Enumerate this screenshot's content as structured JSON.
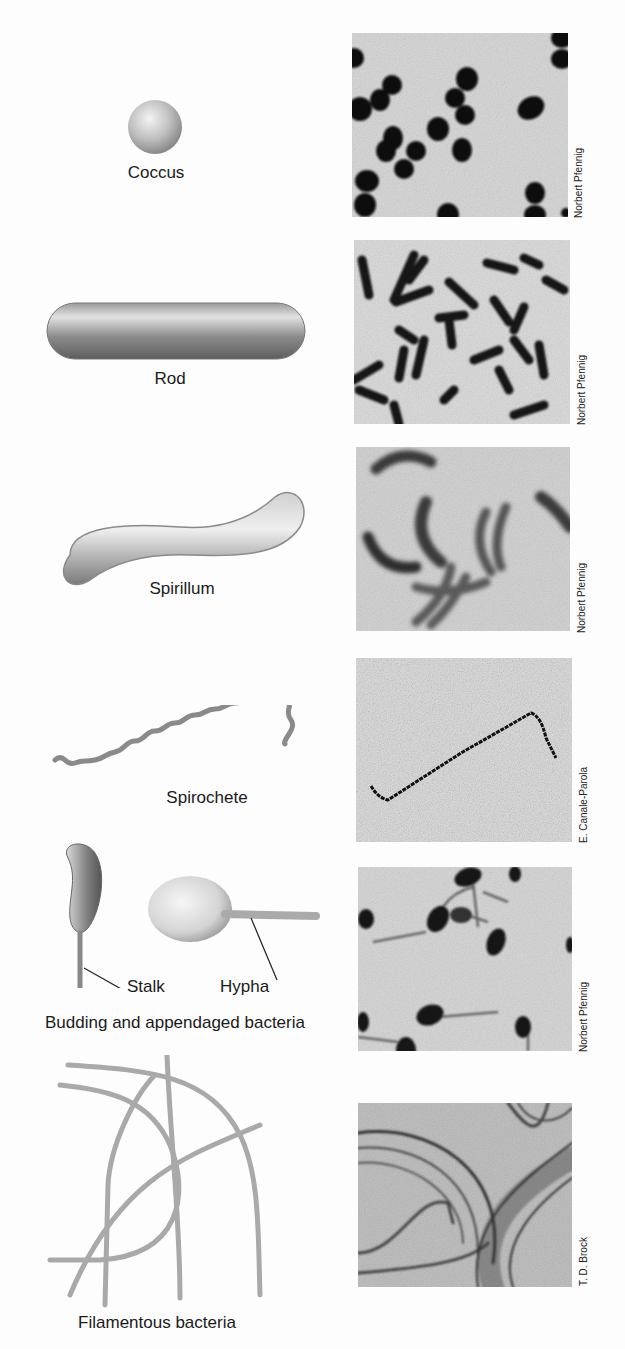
{
  "figure": {
    "rows": [
      {
        "id": "coccus",
        "label": "Coccus",
        "credit": "Norbert Pfennig"
      },
      {
        "id": "rod",
        "label": "Rod",
        "credit": "Norbert Pfennig"
      },
      {
        "id": "spirillum",
        "label": "Spirillum",
        "credit": "Norbert Pfennig"
      },
      {
        "id": "spirochete",
        "label": "Spirochete",
        "credit": "E. Canale-Parola"
      },
      {
        "id": "budding",
        "label": "Budding and appendaged bacteria",
        "credit": "Norbert Pfennig",
        "callouts": {
          "stalk": "Stalk",
          "hypha": "Hypha"
        }
      },
      {
        "id": "filamentous",
        "label": "Filamentous bacteria",
        "credit": "T. D. Brock"
      }
    ]
  }
}
